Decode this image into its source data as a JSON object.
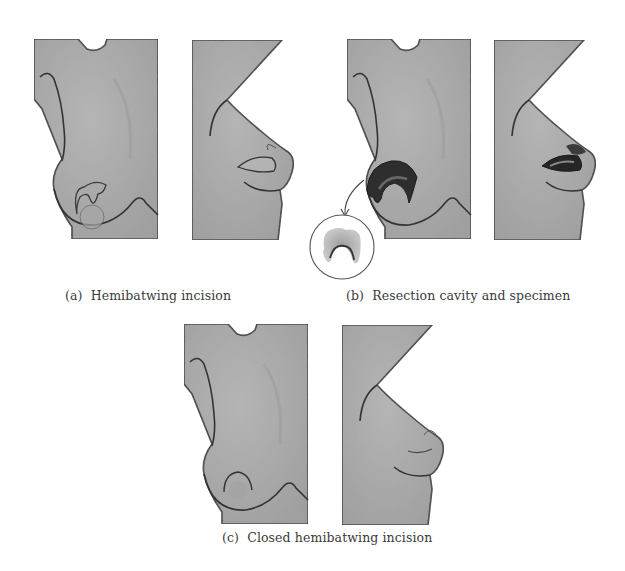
{
  "figure": {
    "panels": [
      {
        "id": "a",
        "label": "(a)",
        "caption": "Hemibatwing incision",
        "views": [
          "frontal view",
          "lateral view"
        ]
      },
      {
        "id": "b",
        "label": "(b)",
        "caption": "Resection cavity and specimen",
        "views": [
          "frontal view",
          "lateral view",
          "specimen inset"
        ]
      },
      {
        "id": "c",
        "label": "(c)",
        "caption": "Closed hemibatwing incision",
        "views": [
          "frontal view",
          "lateral view"
        ]
      }
    ],
    "colors": {
      "skin": "#a9a9a9",
      "outline": "#3a3a3a",
      "cavity": "#2e2e2e",
      "background": "#ffffff"
    }
  }
}
